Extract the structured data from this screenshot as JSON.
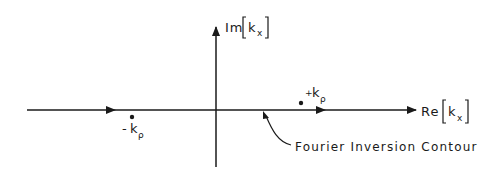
{
  "diagram": {
    "type": "complex-plane contour diagram",
    "colors": {
      "ink": "#1a1a1a",
      "background": "#ffffff"
    },
    "axes": {
      "vertical": {
        "label_prefix": "Im",
        "label_var": "k",
        "label_sub": "x"
      },
      "horizontal": {
        "label_prefix": "Re",
        "label_var": "k",
        "label_sub": "x"
      }
    },
    "poles": [
      {
        "sign": "-",
        "var": "k",
        "sub": "ρ"
      },
      {
        "sign": "+",
        "var": "k",
        "sub": "ρ"
      }
    ],
    "contour": {
      "label": "Fourier Inversion Contour"
    }
  }
}
